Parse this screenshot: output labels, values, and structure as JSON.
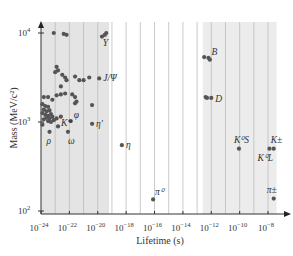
{
  "chart_data": {
    "type": "scatter",
    "title": "",
    "xlabel": "Lifetime (s)",
    "ylabel": "Mass (MeV/c²)",
    "x_scale": "log",
    "y_scale": "log",
    "xlim_exp": [
      -24,
      -7.5
    ],
    "ylim_exp": [
      2,
      4.1
    ],
    "x_ticks": [
      {
        "exp": -24,
        "label": "10",
        "sup": "−24"
      },
      {
        "exp": -22,
        "label": "10",
        "sup": "−22"
      },
      {
        "exp": -20,
        "label": "10",
        "sup": "−20"
      },
      {
        "exp": -18,
        "label": "10",
        "sup": "−18"
      },
      {
        "exp": -16,
        "label": "10",
        "sup": "−16"
      },
      {
        "exp": -14,
        "label": "10",
        "sup": "−14"
      },
      {
        "exp": -12,
        "label": "10",
        "sup": "−12"
      },
      {
        "exp": -10,
        "label": "10",
        "sup": "−10"
      },
      {
        "exp": -8,
        "label": "10",
        "sup": "−8"
      }
    ],
    "y_ticks": [
      {
        "exp": 2,
        "label": "10",
        "sup": "2"
      },
      {
        "exp": 3,
        "label": "10",
        "sup": "3"
      },
      {
        "exp": 4,
        "label": "10",
        "sup": "4"
      }
    ],
    "grid": "vertical lines every decade",
    "shaded_regions": [
      {
        "from_exp": -24,
        "to_exp": -19.2,
        "color": "#e4e4e4"
      },
      {
        "from_exp": -12.6,
        "to_exp": -7.4,
        "color": "#ececec"
      }
    ],
    "colors": {
      "point": "#555555",
      "axis": "#333333",
      "grid": "#bdbdbd"
    },
    "labeled_points": [
      {
        "label": "Υ",
        "log_tau": -19.5,
        "log_m": 3.98,
        "dx": -2,
        "dy": 11
      },
      {
        "label": "J/Ψ",
        "log_tau": -19.9,
        "log_m": 3.49,
        "dx": 4,
        "dy": 3
      },
      {
        "label": "η′",
        "log_tau": -20.4,
        "log_m": 2.98,
        "dx": 4,
        "dy": 3
      },
      {
        "label": "η",
        "log_tau": -18.3,
        "log_m": 2.74,
        "dx": 4,
        "dy": 3
      },
      {
        "label": "π⁰",
        "log_tau": -16.1,
        "log_m": 2.13,
        "dx": 2,
        "dy": -4
      },
      {
        "label": "B",
        "log_tau": -12.2,
        "log_m": 3.72,
        "dx": 3,
        "dy": -3
      },
      {
        "label": "D",
        "log_tau": -12.0,
        "log_m": 3.27,
        "dx": 4,
        "dy": 4
      },
      {
        "label": "K⁰S",
        "log_tau": -10.05,
        "log_m": 2.7,
        "dx": -5,
        "dy": -6
      },
      {
        "label": "K⁰L",
        "log_tau": -7.9,
        "log_m": 2.7,
        "dx": -12,
        "dy": 12
      },
      {
        "label": "K±",
        "log_tau": -7.6,
        "log_m": 2.7,
        "dx": -3,
        "dy": -6
      },
      {
        "label": "π±",
        "log_tau": -7.6,
        "log_m": 2.14,
        "dx": -7,
        "dy": -6
      },
      {
        "label": "ρ",
        "log_tau": -23.4,
        "log_m": 2.89,
        "dx": -3,
        "dy": 12
      },
      {
        "label": "K*",
        "log_tau": -22.8,
        "log_m": 2.95,
        "dx": 3,
        "dy": 0
      },
      {
        "label": "ω",
        "log_tau": -22.1,
        "log_m": 2.89,
        "dx": 0,
        "dy": 12
      },
      {
        "label": "φ",
        "log_tau": -21.9,
        "log_m": 3.01,
        "dx": 3,
        "dy": -3
      }
    ],
    "unlabeled_points": [
      {
        "log_tau": -23.1,
        "log_m": 4.0
      },
      {
        "log_tau": -22.4,
        "log_m": 3.99
      },
      {
        "log_tau": -22.2,
        "log_m": 3.98
      },
      {
        "log_tau": -19.7,
        "log_m": 3.96
      },
      {
        "log_tau": -19.4,
        "log_m": 4.0
      },
      {
        "log_tau": -22.9,
        "log_m": 3.62
      },
      {
        "log_tau": -23.0,
        "log_m": 3.56
      },
      {
        "log_tau": -22.8,
        "log_m": 3.58
      },
      {
        "log_tau": -22.5,
        "log_m": 3.53
      },
      {
        "log_tau": -22.3,
        "log_m": 3.5
      },
      {
        "log_tau": -22.2,
        "log_m": 3.47
      },
      {
        "log_tau": -21.6,
        "log_m": 3.51
      },
      {
        "log_tau": -21.3,
        "log_m": 3.47
      },
      {
        "log_tau": -21.0,
        "log_m": 3.47
      },
      {
        "log_tau": -20.6,
        "log_m": 3.5
      },
      {
        "log_tau": -22.6,
        "log_m": 3.4
      },
      {
        "log_tau": -22.9,
        "log_m": 3.3
      },
      {
        "log_tau": -22.6,
        "log_m": 3.31
      },
      {
        "log_tau": -22.3,
        "log_m": 3.32
      },
      {
        "log_tau": -21.8,
        "log_m": 3.31
      },
      {
        "log_tau": -21.6,
        "log_m": 3.28
      },
      {
        "log_tau": -21.5,
        "log_m": 3.23
      },
      {
        "log_tau": -21.6,
        "log_m": 3.21
      },
      {
        "log_tau": -23.8,
        "log_m": 3.28
      },
      {
        "log_tau": -23.5,
        "log_m": 3.28
      },
      {
        "log_tau": -23.2,
        "log_m": 3.25
      },
      {
        "log_tau": -20.4,
        "log_m": 3.19
      },
      {
        "log_tau": -23.9,
        "log_m": 3.2
      },
      {
        "log_tau": -23.7,
        "log_m": 3.18
      },
      {
        "log_tau": -23.5,
        "log_m": 3.17
      },
      {
        "log_tau": -23.8,
        "log_m": 3.14
      },
      {
        "log_tau": -23.6,
        "log_m": 3.12
      },
      {
        "log_tau": -23.4,
        "log_m": 3.13
      },
      {
        "log_tau": -23.9,
        "log_m": 3.1
      },
      {
        "log_tau": -23.7,
        "log_m": 3.08
      },
      {
        "log_tau": -23.5,
        "log_m": 3.07
      },
      {
        "log_tau": -23.3,
        "log_m": 3.09
      },
      {
        "log_tau": -23.6,
        "log_m": 3.05
      },
      {
        "log_tau": -23.4,
        "log_m": 3.04
      },
      {
        "log_tau": -23.2,
        "log_m": 3.06
      },
      {
        "log_tau": -23.5,
        "log_m": 3.01
      },
      {
        "log_tau": -23.3,
        "log_m": 3.0
      },
      {
        "log_tau": -23.1,
        "log_m": 3.02
      },
      {
        "log_tau": -23.8,
        "log_m": 3.03
      },
      {
        "log_tau": -22.9,
        "log_m": 3.04
      },
      {
        "log_tau": -22.6,
        "log_m": 3.06
      },
      {
        "log_tau": -23.9,
        "log_m": 2.97
      },
      {
        "log_tau": -12.5,
        "log_m": 3.73
      },
      {
        "log_tau": -12.1,
        "log_m": 3.7
      },
      {
        "log_tau": -12.4,
        "log_m": 3.28
      },
      {
        "log_tau": -12.3,
        "log_m": 3.27
      }
    ]
  }
}
